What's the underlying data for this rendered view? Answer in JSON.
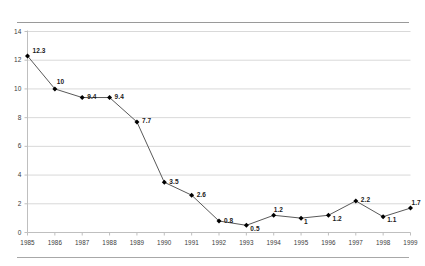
{
  "chart_data": {
    "type": "line",
    "title": "",
    "subtitle": "",
    "xlabel": "",
    "ylabel": "",
    "categories": [
      "1985",
      "1986",
      "1987",
      "1988",
      "1989",
      "1990",
      "1991",
      "1992",
      "1993",
      "1994",
      "1995",
      "1996",
      "1997",
      "1998",
      "1999"
    ],
    "values": [
      12.3,
      10,
      9.4,
      9.4,
      7.7,
      3.5,
      2.6,
      0.8,
      0.5,
      1.2,
      1,
      1.2,
      2.2,
      1.1,
      1.7
    ],
    "point_labels": [
      "12.3",
      "10",
      "9.4",
      "9.4",
      "7.7",
      "3.5",
      "2.6",
      "0.8",
      "0.5",
      "1.2",
      "1",
      "1.2",
      "2.2",
      "1.1",
      "1.7"
    ],
    "ylim": [
      0,
      14
    ],
    "yticks": [
      0,
      2,
      4,
      6,
      8,
      10,
      12,
      14
    ],
    "ytick_labels": [
      "0",
      "2",
      "4",
      "6",
      "8",
      "10",
      "12",
      "14"
    ],
    "grid": "horizontal",
    "legend": "none",
    "series": [
      {
        "name": "",
        "values": [
          12.3,
          10,
          9.4,
          9.4,
          7.7,
          3.5,
          2.6,
          0.8,
          0.5,
          1.2,
          1,
          1.2,
          2.2,
          1.1,
          1.7
        ],
        "marker": "diamond",
        "line_color": "#595959",
        "marker_color": "#000000"
      }
    ],
    "colors": {
      "line": "#595959",
      "marker": "#000000",
      "gridline": "#d9d9d9",
      "axis": "#bfbfbf",
      "text": "#3b3b3b",
      "rule": "#9a9a9a",
      "background": "#ffffff"
    }
  },
  "rules": {
    "top": "",
    "bottom": ""
  }
}
